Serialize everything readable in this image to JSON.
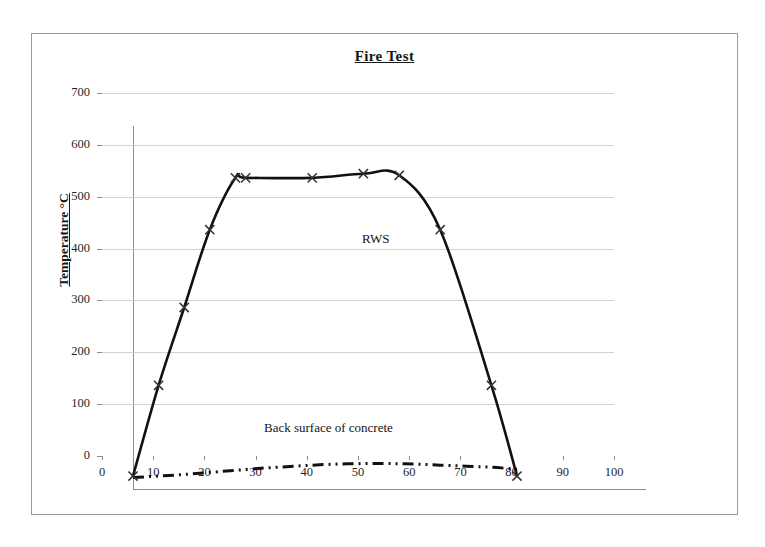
{
  "chart_data": {
    "type": "line",
    "title": "Fire Test",
    "xlabel": "",
    "ylabel": "Temperature °C",
    "xlim": [
      0,
      100
    ],
    "ylim": [
      0,
      700
    ],
    "xticks": [
      0,
      10,
      20,
      30,
      40,
      50,
      60,
      70,
      80,
      90,
      100
    ],
    "yticks": [
      0,
      100,
      200,
      300,
      400,
      500,
      600,
      700
    ],
    "grid": "horizontal",
    "legend_position": "inline-annotation",
    "series": [
      {
        "name": "RWS",
        "style": "solid",
        "marker": "x",
        "color": "#111111",
        "annotation": "RWS",
        "points": [
          {
            "x": 0,
            "y": 25
          },
          {
            "x": 5,
            "y": 200
          },
          {
            "x": 10,
            "y": 350
          },
          {
            "x": 15,
            "y": 500
          },
          {
            "x": 20,
            "y": 600
          },
          {
            "x": 22,
            "y": 600
          },
          {
            "x": 35,
            "y": 600
          },
          {
            "x": 45,
            "y": 608
          },
          {
            "x": 52,
            "y": 605
          },
          {
            "x": 60,
            "y": 500
          },
          {
            "x": 70,
            "y": 200
          },
          {
            "x": 75,
            "y": 25
          }
        ]
      },
      {
        "name": "Back surface of concrete",
        "style": "dash-dot-dot",
        "marker": "none",
        "color": "#111111",
        "annotation": "Back surface of concrete",
        "points": [
          {
            "x": 0,
            "y": 22
          },
          {
            "x": 5,
            "y": 25
          },
          {
            "x": 10,
            "y": 28
          },
          {
            "x": 15,
            "y": 32
          },
          {
            "x": 20,
            "y": 36
          },
          {
            "x": 25,
            "y": 40
          },
          {
            "x": 30,
            "y": 43
          },
          {
            "x": 35,
            "y": 46
          },
          {
            "x": 40,
            "y": 48
          },
          {
            "x": 45,
            "y": 49
          },
          {
            "x": 50,
            "y": 49
          },
          {
            "x": 55,
            "y": 48
          },
          {
            "x": 60,
            "y": 46
          },
          {
            "x": 65,
            "y": 44
          },
          {
            "x": 70,
            "y": 42
          },
          {
            "x": 75,
            "y": 38
          }
        ]
      }
    ]
  },
  "axes": {
    "y_tick_labels": [
      "700",
      "600",
      "500",
      "400",
      "300",
      "200",
      "100",
      "0"
    ],
    "x_tick_labels": [
      "0",
      "10",
      "20",
      "30",
      "40",
      "50",
      "60",
      "70",
      "80",
      "90",
      "100"
    ]
  },
  "colors": {
    "line": "#111111",
    "grid": "#d2d2d2",
    "axis": "#8c8c8c",
    "frame": "#9a9a9a",
    "background": "#ffffff"
  }
}
